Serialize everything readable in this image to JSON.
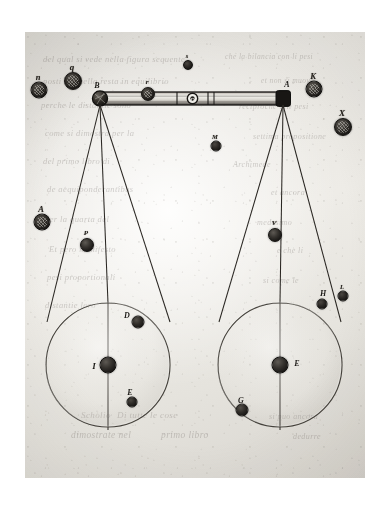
{
  "figure": {
    "domain_note": "engraved plate, aged paper scan",
    "paper_color": "#e6e4df",
    "ink_color": "#1d1b19",
    "plate": {
      "x": 25,
      "y": 32,
      "width": 340,
      "height": 446
    }
  },
  "beam": {
    "name": "balance-beam",
    "left_end_x": 72,
    "right_end_x": 264,
    "y": 60,
    "height": 13,
    "fulcrum_label": "O",
    "left_pivot_label": "B",
    "right_pivot_label": "A"
  },
  "pans": [
    {
      "id": "left-pan",
      "label": "C",
      "center_x": 83,
      "center_y": 333,
      "radius": 62,
      "center_weight_label": "I",
      "contents": [
        {
          "label": "D",
          "size": "medium",
          "x": 113,
          "y": 290
        },
        {
          "label": "E",
          "size": "small",
          "x": 107,
          "y": 370
        }
      ]
    },
    {
      "id": "right-pan",
      "label": "F",
      "center_x": 255,
      "center_y": 333,
      "radius": 62,
      "center_weight_label": "E",
      "contents": [
        {
          "label": "G",
          "size": "medium",
          "x": 217,
          "y": 378
        },
        {
          "label": "H",
          "size": "small",
          "x": 297,
          "y": 272
        }
      ]
    }
  ],
  "scattered_weights": [
    {
      "name": "weight-n",
      "label": "n",
      "size": "medium",
      "textured": true,
      "x": 14,
      "y": 58,
      "d": 17
    },
    {
      "name": "weight-q",
      "label": "q",
      "size": "medium",
      "textured": true,
      "x": 48,
      "y": 49,
      "d": 18
    },
    {
      "name": "weight-a",
      "label": "A",
      "size": "medium",
      "textured": true,
      "x": 17,
      "y": 190,
      "d": 17
    },
    {
      "name": "weight-p",
      "label": "P",
      "size": "large",
      "textured": false,
      "x": 62,
      "y": 213,
      "d": 14
    },
    {
      "name": "weight-s",
      "label": "s",
      "size": "small",
      "textured": false,
      "x": 163,
      "y": 33,
      "d": 10
    },
    {
      "name": "weight-r",
      "label": "r",
      "size": "medium",
      "textured": true,
      "x": 123,
      "y": 62,
      "d": 14
    },
    {
      "name": "weight-m",
      "label": "M",
      "size": "small",
      "textured": false,
      "x": 191,
      "y": 114,
      "d": 11
    },
    {
      "name": "weight-k",
      "label": "K",
      "size": "large",
      "textured": true,
      "x": 289,
      "y": 57,
      "d": 17
    },
    {
      "name": "weight-x",
      "label": "X",
      "size": "large",
      "textured": true,
      "x": 318,
      "y": 95,
      "d": 18
    },
    {
      "name": "weight-v",
      "label": "V",
      "size": "large",
      "textured": false,
      "x": 250,
      "y": 203,
      "d": 14
    },
    {
      "name": "weight-l",
      "label": "L",
      "size": "small",
      "textured": false,
      "x": 318,
      "y": 264,
      "d": 11
    }
  ],
  "ghost_text": [
    {
      "text": "del qual si vede nella figura sequente",
      "x": 18,
      "y": 22,
      "size": 8.5
    },
    {
      "text": "che la bilancia con li pesi",
      "x": 200,
      "y": 20,
      "size": 7.5
    },
    {
      "text": "posti in quella resta in equilibrio",
      "x": 18,
      "y": 44,
      "size": 8.5
    },
    {
      "text": "et non si muove",
      "x": 236,
      "y": 44,
      "size": 7.5
    },
    {
      "text": "perche le distantie sono",
      "x": 16,
      "y": 68,
      "size": 8.5
    },
    {
      "text": "reciproche alli pesi",
      "x": 214,
      "y": 70,
      "size": 8.0
    },
    {
      "text": "come si dimostra per la",
      "x": 20,
      "y": 96,
      "size": 8.5
    },
    {
      "text": "settima propositione",
      "x": 228,
      "y": 100,
      "size": 8.0
    },
    {
      "text": "del primo libro di",
      "x": 18,
      "y": 124,
      "size": 8.5
    },
    {
      "text": "Archimede",
      "x": 208,
      "y": 128,
      "size": 8.0
    },
    {
      "text": "de aequiponderantibus",
      "x": 22,
      "y": 152,
      "size": 8.5
    },
    {
      "text": "et ancora",
      "x": 246,
      "y": 156,
      "size": 8.0
    },
    {
      "text": "per la quarta del",
      "x": 20,
      "y": 182,
      "size": 8.5
    },
    {
      "text": "medesimo",
      "x": 232,
      "y": 186,
      "size": 8.0
    },
    {
      "text": "Et pero manifesto",
      "x": 24,
      "y": 212,
      "size": 8.5
    },
    {
      "text": "e che li",
      "x": 252,
      "y": 214,
      "size": 8.0
    },
    {
      "text": "pesi proportionali",
      "x": 22,
      "y": 240,
      "size": 8.5
    },
    {
      "text": "si come le",
      "x": 238,
      "y": 244,
      "size": 8.0
    },
    {
      "text": "distantie loro",
      "x": 20,
      "y": 268,
      "size": 8.5
    },
    {
      "text": "Scholio",
      "x": 56,
      "y": 378,
      "size": 9.0
    },
    {
      "text": "Di tutte le cose",
      "x": 92,
      "y": 378,
      "size": 9.0
    },
    {
      "text": "dimostrate nel",
      "x": 46,
      "y": 398,
      "size": 9.5
    },
    {
      "text": "primo libro",
      "x": 136,
      "y": 398,
      "size": 9.5
    },
    {
      "text": "si puo ancora",
      "x": 244,
      "y": 380,
      "size": 8.0
    },
    {
      "text": "dedurre",
      "x": 268,
      "y": 400,
      "size": 8.0
    }
  ]
}
